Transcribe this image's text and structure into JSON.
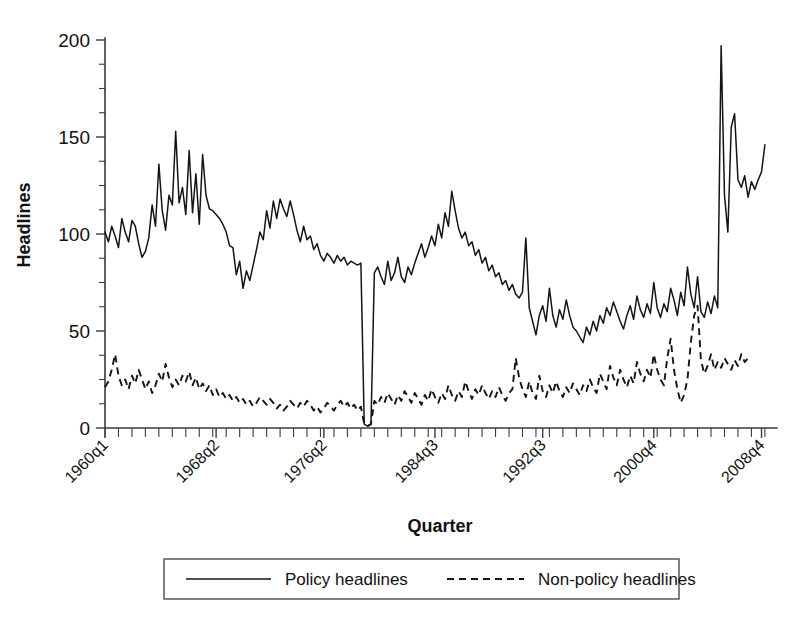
{
  "chart_data": {
    "type": "line",
    "title": "",
    "xlabel": "Quarter",
    "ylabel": "Headlines",
    "ylim": [
      0,
      200
    ],
    "yticks": [
      0,
      50,
      100,
      150,
      200
    ],
    "ytick_labels": [
      "0",
      "50",
      "100",
      "150",
      "200"
    ],
    "yminor_step": 12.5,
    "grid": false,
    "legend_position": "below-plot",
    "x_start_label": "1960q1",
    "x_end_label": "2009q4",
    "xtick_labels": [
      "1960q1",
      "1968q2",
      "1976q2",
      "1984q3",
      "1992q3",
      "2000q4",
      "2008q4"
    ],
    "xtick_indices": [
      0,
      33,
      65,
      98,
      130,
      163,
      195
    ],
    "n_points": 200,
    "series": [
      {
        "name": "Policy headlines",
        "style": "solid",
        "color": "#141414",
        "values": [
          101,
          96,
          104,
          99,
          93,
          108,
          101,
          96,
          107,
          104,
          95,
          88,
          91,
          98,
          115,
          104,
          136,
          112,
          102,
          120,
          115,
          153,
          116,
          124,
          110,
          143,
          111,
          131,
          105,
          141,
          120,
          113,
          112,
          110,
          108,
          105,
          101,
          94,
          93,
          79,
          86,
          72,
          81,
          76,
          84,
          92,
          101,
          97,
          112,
          103,
          117,
          108,
          118,
          113,
          109,
          117,
          110,
          102,
          96,
          104,
          97,
          99,
          92,
          95,
          89,
          86,
          90,
          88,
          85,
          89,
          86,
          88,
          84,
          86,
          85,
          84,
          85,
          2,
          1,
          2,
          80,
          83,
          78,
          74,
          86,
          76,
          80,
          88,
          78,
          75,
          83,
          79,
          85,
          90,
          95,
          88,
          93,
          99,
          94,
          105,
          98,
          111,
          104,
          122,
          112,
          103,
          98,
          101,
          94,
          96,
          89,
          92,
          85,
          88,
          81,
          84,
          78,
          80,
          74,
          76,
          71,
          74,
          69,
          67,
          70,
          98,
          62,
          55,
          48,
          58,
          63,
          55,
          72,
          58,
          52,
          61,
          56,
          66,
          58,
          52,
          50,
          47,
          44,
          52,
          48,
          55,
          50,
          58,
          54,
          62,
          58,
          65,
          60,
          55,
          51,
          58,
          63,
          56,
          68,
          61,
          57,
          64,
          59,
          75,
          62,
          57,
          64,
          60,
          72,
          66,
          58,
          70,
          63,
          83,
          69,
          62,
          78,
          60,
          57,
          65,
          59,
          68,
          62,
          197,
          120,
          101,
          155,
          162,
          128,
          124,
          130,
          119,
          127,
          123,
          128,
          132,
          146
        ]
      },
      {
        "name": "Non-policy headlines",
        "style": "dashed",
        "color": "#141414",
        "values": [
          21,
          24,
          30,
          38,
          27,
          22,
          25,
          20,
          27,
          23,
          30,
          25,
          20,
          24,
          18,
          22,
          28,
          24,
          33,
          26,
          21,
          25,
          22,
          27,
          24,
          29,
          22,
          26,
          20,
          23,
          19,
          22,
          17,
          20,
          16,
          18,
          15,
          17,
          14,
          16,
          13,
          15,
          12,
          14,
          11,
          13,
          16,
          14,
          12,
          15,
          13,
          10,
          12,
          9,
          11,
          14,
          12,
          10,
          13,
          11,
          14,
          12,
          9,
          11,
          8,
          10,
          13,
          11,
          9,
          12,
          14,
          11,
          13,
          10,
          12,
          9,
          11,
          2,
          1,
          2,
          14,
          12,
          16,
          13,
          18,
          15,
          12,
          17,
          14,
          19,
          16,
          13,
          18,
          15,
          12,
          17,
          14,
          20,
          16,
          13,
          18,
          15,
          22,
          17,
          14,
          19,
          16,
          24,
          19,
          15,
          20,
          17,
          22,
          18,
          15,
          19,
          16,
          21,
          17,
          14,
          18,
          20,
          36,
          26,
          20,
          16,
          24,
          18,
          15,
          27,
          19,
          16,
          22,
          18,
          24,
          19,
          16,
          21,
          18,
          23,
          20,
          17,
          22,
          19,
          25,
          21,
          18,
          28,
          24,
          20,
          32,
          26,
          22,
          30,
          25,
          21,
          27,
          23,
          34,
          28,
          24,
          30,
          26,
          38,
          30,
          25,
          22,
          36,
          46,
          30,
          20,
          13,
          17,
          25,
          44,
          58,
          63,
          35,
          28,
          32,
          38,
          30,
          34,
          31,
          36,
          33,
          30,
          35,
          32,
          38,
          34,
          36
        ]
      }
    ]
  },
  "legend": {
    "entries": [
      {
        "label": "Policy headlines",
        "style": "solid"
      },
      {
        "label": "Non-policy headlines",
        "style": "dashed"
      }
    ]
  }
}
